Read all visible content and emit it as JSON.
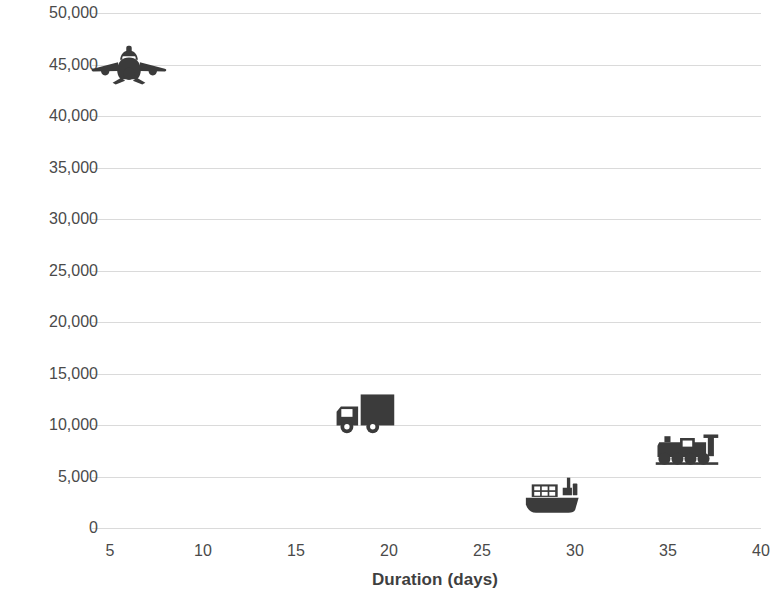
{
  "chart_data": {
    "type": "scatter",
    "title": "",
    "xlabel": "Duration (days)",
    "ylabel": "costs (USD)",
    "xlim": [
      5,
      40
    ],
    "ylim": [
      0,
      50000
    ],
    "grid": true,
    "legend": "none",
    "x_ticks": [
      "5",
      "10",
      "15",
      "20",
      "25",
      "30",
      "35",
      "40"
    ],
    "x_tick_values": [
      5,
      10,
      15,
      20,
      25,
      30,
      35,
      40
    ],
    "y_ticks": [
      "0",
      "5,000",
      "10,000",
      "15,000",
      "20,000",
      "25,000",
      "30,000",
      "35,000",
      "40,000",
      "45,000",
      "50,000"
    ],
    "y_tick_values": [
      0,
      5000,
      10000,
      15000,
      20000,
      25000,
      30000,
      35000,
      40000,
      45000,
      50000
    ],
    "points": [
      {
        "label": "air",
        "marker": "airplane-icon",
        "x": 6.0,
        "y": 45000
      },
      {
        "label": "road",
        "marker": "truck-icon",
        "x": 18.7,
        "y": 11200
      },
      {
        "label": "sea",
        "marker": "ship-icon",
        "x": 28.7,
        "y": 3100
      },
      {
        "label": "rail",
        "marker": "train-icon",
        "x": 36.0,
        "y": 7800
      }
    ],
    "colors": {
      "marker": "#3b3b3b",
      "gridline": "#d6d6d6",
      "text": "#3f3f3f",
      "background": "#ffffff"
    }
  }
}
